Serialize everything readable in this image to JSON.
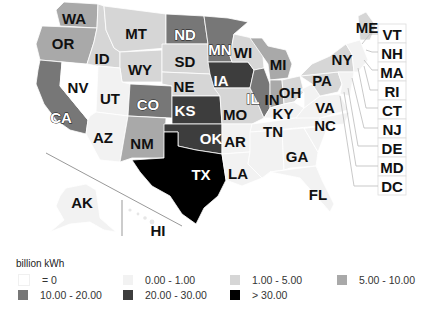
{
  "legend": {
    "title": "billion kWh",
    "classes": [
      {
        "label": "= 0",
        "color": "#ffffff"
      },
      {
        "label": "0.00 - 1.00",
        "color": "#f2f2f2"
      },
      {
        "label": "1.00 - 5.00",
        "color": "#d6d6d6"
      },
      {
        "label": "5.00 - 10.00",
        "color": "#a9a9a9"
      },
      {
        "label": "10.00 - 20.00",
        "color": "#777777"
      },
      {
        "label": "20.00 - 30.00",
        "color": "#3d3d3d"
      },
      {
        "label": "> 30.00",
        "color": "#000000"
      }
    ]
  },
  "states": {
    "WA": {
      "label": "WA",
      "class": "5.00 - 10.00"
    },
    "OR": {
      "label": "OR",
      "class": "5.00 - 10.00"
    },
    "CA": {
      "label": "CA",
      "class": "10.00 - 20.00"
    },
    "NV": {
      "label": "NV",
      "class": "= 0"
    },
    "ID": {
      "label": "ID",
      "class": "1.00 - 5.00"
    },
    "MT": {
      "label": "MT",
      "class": "1.00 - 5.00"
    },
    "WY": {
      "label": "WY",
      "class": "1.00 - 5.00"
    },
    "UT": {
      "label": "UT",
      "class": "0.00 - 1.00"
    },
    "AZ": {
      "label": "AZ",
      "class": "0.00 - 1.00"
    },
    "CO": {
      "label": "CO",
      "class": "10.00 - 20.00"
    },
    "NM": {
      "label": "NM",
      "class": "5.00 - 10.00"
    },
    "ND": {
      "label": "ND",
      "class": "10.00 - 20.00"
    },
    "SD": {
      "label": "SD",
      "class": "1.00 - 5.00"
    },
    "NE": {
      "label": "NE",
      "class": "1.00 - 5.00"
    },
    "KS": {
      "label": "KS",
      "class": "20.00 - 30.00"
    },
    "OK": {
      "label": "OK",
      "class": "20.00 - 30.00"
    },
    "TX": {
      "label": "TX",
      "class": "> 30.00"
    },
    "MN": {
      "label": "MN",
      "class": "10.00 - 20.00"
    },
    "IA": {
      "label": "IA",
      "class": "20.00 - 30.00"
    },
    "MO": {
      "label": "MO",
      "class": "1.00 - 5.00"
    },
    "AR": {
      "label": "AR",
      "class": "0.00 - 1.00"
    },
    "LA": {
      "label": "LA",
      "class": "0.00 - 1.00"
    },
    "WI": {
      "label": "WI",
      "class": "1.00 - 5.00"
    },
    "IL": {
      "label": "IL",
      "class": "10.00 - 20.00"
    },
    "MI": {
      "label": "MI",
      "class": "5.00 - 10.00"
    },
    "IN": {
      "label": "IN",
      "class": "5.00 - 10.00"
    },
    "OH": {
      "label": "OH",
      "class": "1.00 - 5.00"
    },
    "KY": {
      "label": "KY",
      "class": "0.00 - 1.00"
    },
    "TN": {
      "label": "TN",
      "class": "0.00 - 1.00"
    },
    "GA": {
      "label": "GA",
      "class": "0.00 - 1.00"
    },
    "FL": {
      "label": "FL",
      "class": "0.00 - 1.00"
    },
    "NC": {
      "label": "NC",
      "class": "0.00 - 1.00"
    },
    "VA": {
      "label": "VA",
      "class": "0.00 - 1.00"
    },
    "PA": {
      "label": "PA",
      "class": "1.00 - 5.00"
    },
    "NY": {
      "label": "NY",
      "class": "1.00 - 5.00"
    },
    "ME": {
      "label": "ME",
      "class": "1.00 - 5.00"
    },
    "AK": {
      "label": "AK",
      "class": "0.00 - 1.00"
    },
    "HI": {
      "label": "HI",
      "class": "0.00 - 1.00"
    }
  },
  "side_labels": [
    "VT",
    "NH",
    "MA",
    "RI",
    "CT",
    "NJ",
    "DE",
    "MD",
    "DC"
  ]
}
